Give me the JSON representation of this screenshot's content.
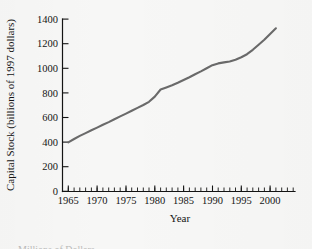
{
  "figure": {
    "background_color": "#f7f7f6",
    "line_color": "#6a6a6a",
    "axis_color": "#141414"
  },
  "chart_data": {
    "type": "line",
    "title": "",
    "xlabel": "Year",
    "ylabel": "Capital Stock (billions of 1997 dollars)",
    "xlim": [
      1964,
      2002
    ],
    "ylim": [
      0,
      1400
    ],
    "xticks": [
      1965,
      1970,
      1975,
      1980,
      1985,
      1990,
      1995,
      2000
    ],
    "xtick_labels": [
      "1965",
      "1970",
      "1975",
      "1980",
      "1985",
      "1990",
      "1995",
      "2000"
    ],
    "yticks": [
      0,
      200,
      400,
      600,
      800,
      1000,
      1200,
      1400
    ],
    "ytick_labels": [
      "0",
      "200",
      "400",
      "600",
      "800",
      "1000",
      "1200",
      "1400"
    ],
    "minor_xtick_interval": 1,
    "grid": false,
    "legend": null,
    "x": [
      1965,
      1966,
      1967,
      1968,
      1969,
      1970,
      1971,
      1972,
      1973,
      1974,
      1975,
      1976,
      1977,
      1978,
      1979,
      1980,
      1981,
      1982,
      1983,
      1984,
      1985,
      1986,
      1987,
      1988,
      1989,
      1990,
      1991,
      1992,
      1993,
      1994,
      1995,
      1996,
      1997,
      1998,
      1999,
      2000,
      2001
    ],
    "values": [
      398,
      425,
      450,
      473,
      496,
      518,
      541,
      563,
      586,
      609,
      632,
      655,
      678,
      702,
      728,
      770,
      828,
      845,
      862,
      882,
      905,
      928,
      952,
      975,
      1000,
      1025,
      1040,
      1048,
      1055,
      1070,
      1090,
      1115,
      1150,
      1192,
      1232,
      1280,
      1325
    ]
  },
  "caption": {
    "cut_off_line": "Millions of Dollars"
  }
}
